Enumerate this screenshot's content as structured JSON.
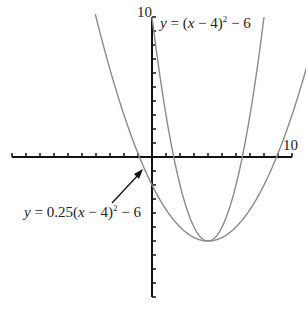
{
  "axes": {
    "x_max_label": "10",
    "y_max_label": "10",
    "xrange": [
      -10,
      10
    ],
    "yrange": [
      -10,
      10
    ]
  },
  "curves": [
    {
      "name": "narrow-parabola",
      "label": "y = (x − 4)² − 6",
      "a": 1,
      "h": 4,
      "k": -6,
      "color": "#8a8a8a"
    },
    {
      "name": "wide-parabola",
      "label": "y = 0.25(x − 4)² − 6",
      "a": 0.25,
      "h": 4,
      "k": -6,
      "color": "#8a8a8a"
    }
  ],
  "labels": {
    "narrow": {
      "y": "y",
      "eq": " = (",
      "x": "x",
      "rest": " − 4)",
      "sup": "2",
      "tail": " − 6"
    },
    "wide": {
      "y": "y",
      "eq": " = 0.25(",
      "x": "x",
      "rest": " − 4)",
      "sup": "2",
      "tail": " − 6"
    }
  },
  "chart_data": {
    "type": "line",
    "title": "",
    "xlabel": "",
    "ylabel": "",
    "xlim": [
      -10,
      10
    ],
    "ylim": [
      -10,
      10
    ],
    "series": [
      {
        "name": "y = (x − 4)² − 6",
        "x": [
          0.5,
          1,
          2,
          3,
          4,
          5,
          6,
          7,
          7.5
        ],
        "y": [
          6.25,
          3,
          -2,
          -5,
          -6,
          -5,
          -2,
          3,
          6.25
        ]
      },
      {
        "name": "y = 0.25(x − 4)² − 6",
        "x": [
          -1,
          0,
          2,
          4,
          6,
          8,
          10
        ],
        "y": [
          0.25,
          -2,
          -5,
          -6,
          -5,
          -2,
          3
        ]
      }
    ],
    "annotations": [
      "10 (x-axis max)",
      "10 (y-axis max)",
      "arrow pointing to y = 0.25(x − 4)² − 6"
    ]
  }
}
